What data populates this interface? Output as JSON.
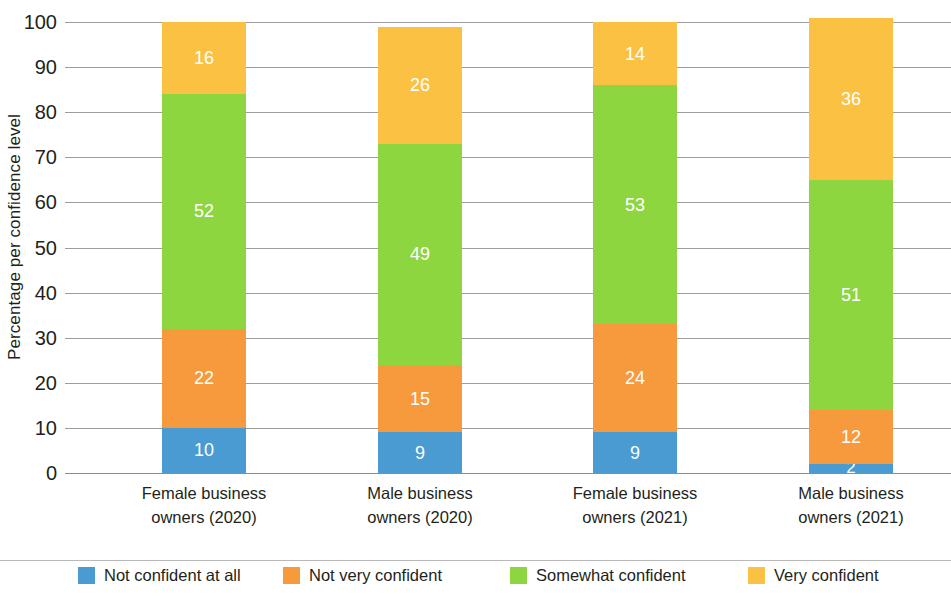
{
  "chart_data": {
    "type": "bar",
    "subtype": "stacked-bar-100",
    "title": "",
    "xlabel": "",
    "ylabel": "Percentage per confidence level",
    "ylim": [
      0,
      100
    ],
    "ytick_step": 10,
    "yticks": [
      0,
      10,
      20,
      30,
      40,
      50,
      60,
      70,
      80,
      90,
      100
    ],
    "grid": true,
    "legend_position": "bottom",
    "categories": [
      "Female business owners (2020)",
      "Male business owners (2020)",
      "Female business owners (2021)",
      "Male business owners (2021)"
    ],
    "category_lines": [
      [
        "Female business",
        "owners (2020)"
      ],
      [
        "Male business",
        "owners (2020)"
      ],
      [
        "Female business",
        "owners (2021)"
      ],
      [
        "Male business",
        "owners (2021)"
      ]
    ],
    "series": [
      {
        "name": "Not confident at all",
        "color": "#4a9bd1",
        "values": [
          10,
          9,
          9,
          2
        ]
      },
      {
        "name": "Not very confident",
        "color": "#f79a3e",
        "values": [
          22,
          15,
          24,
          12
        ]
      },
      {
        "name": "Somewhat confident",
        "color": "#8dd63f",
        "values": [
          52,
          49,
          53,
          51
        ]
      },
      {
        "name": "Very confident",
        "color": "#fbc143",
        "values": [
          16,
          26,
          14,
          36
        ]
      }
    ],
    "column_totals": [
      100,
      99,
      100,
      101
    ]
  },
  "axis": {
    "y_title": "Percentage per confidence level",
    "y_tick_labels": [
      "100",
      "90",
      "80",
      "70",
      "60",
      "50",
      "40",
      "30",
      "20",
      "10",
      "0"
    ]
  },
  "legend": {
    "items": [
      {
        "label": "Not confident at all",
        "color": "#4a9bd1"
      },
      {
        "label": "Not very confident",
        "color": "#f79a3e"
      },
      {
        "label": "Somewhat confident",
        "color": "#8dd63f"
      },
      {
        "label": "Very confident",
        "color": "#fbc143"
      }
    ]
  }
}
